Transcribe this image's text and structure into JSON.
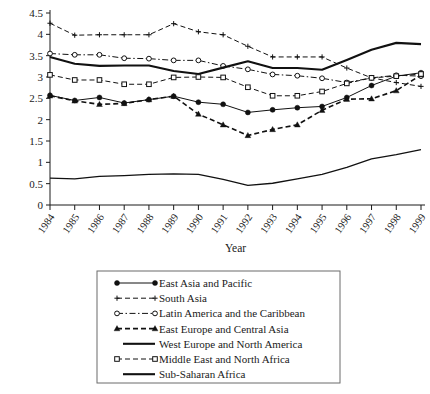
{
  "chart_data": {
    "type": "line",
    "title": "",
    "xlabel": "Year",
    "ylabel": "",
    "categories": [
      "1984",
      "1985",
      "1986",
      "1987",
      "1988",
      "1989",
      "1990",
      "1991",
      "1992",
      "1993",
      "1994",
      "1995",
      "1996",
      "1997",
      "1998",
      "1999"
    ],
    "x": [
      1984,
      1985,
      1986,
      1987,
      1988,
      1989,
      1990,
      1991,
      1992,
      1993,
      1994,
      1995,
      1996,
      1997,
      1998,
      1999
    ],
    "xlim": [
      1984,
      1999
    ],
    "ylim": [
      0,
      4.5
    ],
    "yticks": [
      "0",
      "0.5",
      "1",
      "1.5",
      "2",
      "2.5",
      "3",
      "3.5",
      "4",
      "4.5"
    ],
    "ytick_values": [
      0,
      0.5,
      1,
      1.5,
      2,
      2.5,
      3,
      3.5,
      4,
      4.5
    ],
    "grid": false,
    "legend_position": "below",
    "series": [
      {
        "name": "East Asia and Pacific",
        "marker": "filled-circle",
        "linestyle": "solid",
        "linewidth": 1,
        "color": "#111111",
        "values": [
          2.57,
          2.45,
          2.52,
          2.39,
          2.47,
          2.55,
          2.41,
          2.36,
          2.17,
          2.23,
          2.28,
          2.31,
          2.52,
          2.8,
          3.02,
          3.1
        ]
      },
      {
        "name": "South Asia",
        "marker": "plus",
        "linestyle": "dashed",
        "linewidth": 1,
        "color": "#111111",
        "values": [
          4.26,
          3.98,
          3.99,
          3.99,
          3.99,
          4.25,
          4.06,
          3.99,
          3.72,
          3.47,
          3.47,
          3.47,
          3.21,
          2.98,
          2.87,
          2.78
        ]
      },
      {
        "name": "Latin America and the Caribbean",
        "marker": "open-circle",
        "linestyle": "dash-dot",
        "linewidth": 1,
        "color": "#111111",
        "values": [
          3.55,
          3.52,
          3.52,
          3.44,
          3.43,
          3.39,
          3.39,
          3.26,
          3.18,
          3.06,
          3.03,
          2.97,
          2.87,
          2.98,
          3.04,
          3.02
        ]
      },
      {
        "name": "East Europe and Central Asia",
        "marker": "filled-triangle",
        "linestyle": "dashed",
        "linewidth": 1.6,
        "color": "#111111",
        "values": [
          2.56,
          2.44,
          2.36,
          2.38,
          2.47,
          2.55,
          2.13,
          1.88,
          1.63,
          1.77,
          1.88,
          2.22,
          2.48,
          2.49,
          2.68,
          3.05
        ]
      },
      {
        "name": "West Europe and North America",
        "marker": "none",
        "linestyle": "solid",
        "linewidth": 2.1,
        "color": "#111111",
        "values": [
          3.47,
          3.31,
          3.26,
          3.27,
          3.27,
          3.14,
          3.07,
          3.22,
          3.37,
          3.21,
          3.21,
          3.17,
          3.4,
          3.64,
          3.8,
          3.77
        ]
      },
      {
        "name": "Middle East and North Africa",
        "marker": "open-square",
        "linestyle": "dashed",
        "linewidth": 1,
        "color": "#111111",
        "values": [
          3.05,
          2.93,
          2.93,
          2.83,
          2.83,
          2.99,
          3.0,
          2.99,
          2.76,
          2.56,
          2.56,
          2.66,
          2.85,
          2.98,
          3.02,
          3.07
        ]
      },
      {
        "name": "Sub-Saharan Africa",
        "marker": "none",
        "linestyle": "solid",
        "linewidth": 1.3,
        "color": "#111111",
        "values": [
          0.63,
          0.61,
          0.67,
          0.69,
          0.72,
          0.73,
          0.72,
          0.6,
          0.46,
          0.51,
          0.61,
          0.72,
          0.88,
          1.08,
          1.18,
          1.3
        ]
      }
    ]
  },
  "legend": {
    "items": [
      {
        "label": "East Asia and Pacific",
        "marker": "filled-circle",
        "linestyle": "solid"
      },
      {
        "label": "South Asia",
        "marker": "plus",
        "linestyle": "dashed"
      },
      {
        "label": "Latin America and the Caribbean",
        "marker": "open-circle",
        "linestyle": "dash-dot"
      },
      {
        "label": "East Europe and Central Asia",
        "marker": "filled-triangle",
        "linestyle": "dashed"
      },
      {
        "label": "West Europe and North America",
        "marker": "none",
        "linestyle": "solid"
      },
      {
        "label": "Middle East and North Africa",
        "marker": "open-square",
        "linestyle": "dashed"
      },
      {
        "label": "Sub-Saharan Africa",
        "marker": "none",
        "linestyle": "solid-thick"
      }
    ]
  }
}
